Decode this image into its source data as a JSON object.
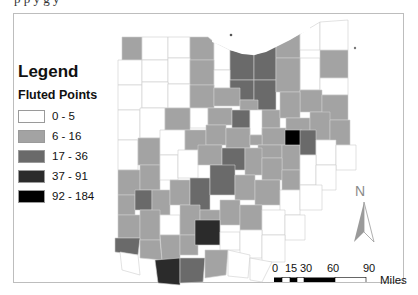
{
  "page": {
    "cutoff_text": "p   p   y   g   y"
  },
  "legend": {
    "title": "Legend",
    "subtitle": "Fluted Points",
    "classes": [
      {
        "label": "0 - 5",
        "color": "#ffffff"
      },
      {
        "label": "6 - 16",
        "color": "#a3a3a3"
      },
      {
        "label": "17 - 36",
        "color": "#6a6a6a"
      },
      {
        "label": "37 - 91",
        "color": "#2b2b2b"
      },
      {
        "label": "92 - 184",
        "color": "#000000"
      }
    ]
  },
  "north_arrow": {
    "label": "N"
  },
  "scale_bar": {
    "ticks": [
      "0",
      "15",
      "30",
      "60",
      "90"
    ],
    "units": "Miles"
  },
  "map": {
    "region": "Ohio counties",
    "counties_by_class": {
      "0-5": 38,
      "6-16": 34,
      "17-36": 10,
      "37-91": 3,
      "92-184": 1
    }
  }
}
